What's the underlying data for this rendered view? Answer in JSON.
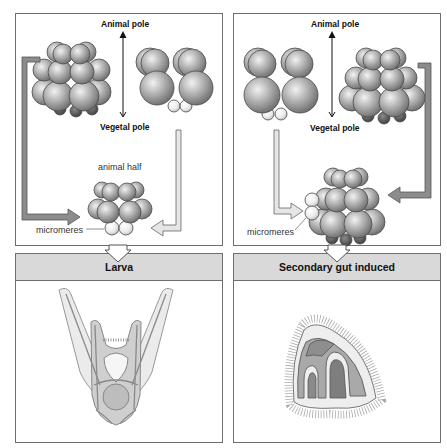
{
  "left_column": {
    "top_panel": {
      "axis_top_label": "Animal pole",
      "axis_bottom_label": "Vegetal pole",
      "result_label": "animal half",
      "micromeres_label": "micromeres"
    },
    "banner": {
      "title": "Larva"
    },
    "bottom_panel": {
      "illustration": "pluteus-larva"
    }
  },
  "right_column": {
    "top_panel": {
      "axis_top_label": "Animal pole",
      "axis_bottom_label": "Vegetal pole",
      "micromeres_label": "micromeres"
    },
    "banner": {
      "title": "Secondary gut induced"
    },
    "bottom_panel": {
      "illustration": "secondary-gut-embryo"
    }
  },
  "colors": {
    "border": "#6e6e6e",
    "banner_fill": "#d9d9d9",
    "sphere_mid": "#a8a8a8",
    "sphere_dark": "#555555",
    "micromere": "#f0f0f0"
  }
}
